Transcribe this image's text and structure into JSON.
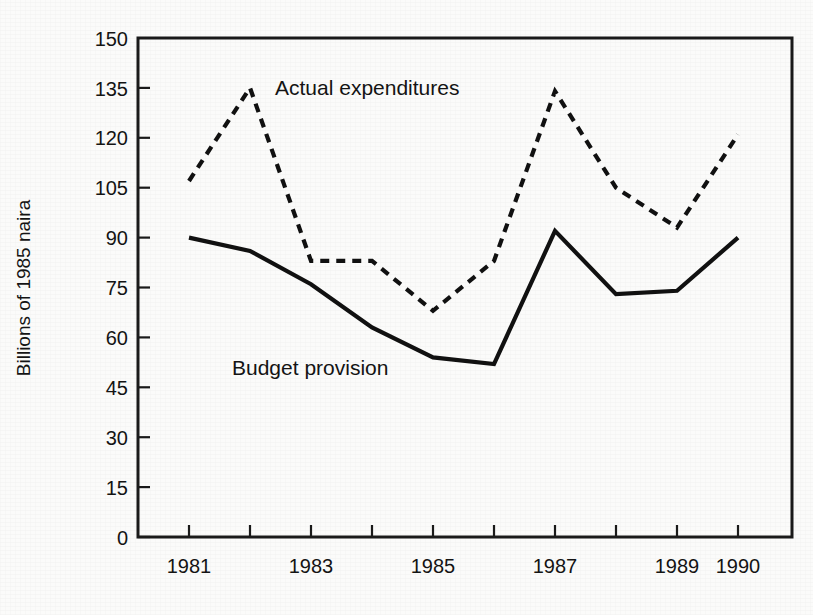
{
  "figure": {
    "background_color": "#fbfbfa",
    "ink_color": "#111111"
  },
  "axis": {
    "y_title": "Billions of 1985 naira",
    "y_ticks": [
      "0",
      "15",
      "30",
      "45",
      "60",
      "75",
      "90",
      "105",
      "120",
      "135",
      "150"
    ],
    "x_ticks": [
      "1981",
      "",
      "1983",
      "",
      "1985",
      "",
      "1987",
      "",
      "1989",
      "1990"
    ]
  },
  "labels": {
    "actual": "Actual expenditures",
    "budget": "Budget provision"
  },
  "chart_data": {
    "type": "line",
    "title": "",
    "xlabel": "",
    "ylabel": "Billions of 1985 naira",
    "ylim": [
      0,
      150
    ],
    "y_tick_step": 15,
    "grid": false,
    "legend_position": "inline-annotations",
    "x": [
      1981,
      1982,
      1983,
      1984,
      1985,
      1986,
      1987,
      1988,
      1989,
      1990
    ],
    "x_tick_labels": [
      "1981",
      "",
      "1983",
      "",
      "1985",
      "",
      "1987",
      "",
      "1989",
      "1990"
    ],
    "series": [
      {
        "name": "Actual expenditures",
        "style": "dashed",
        "values": [
          107,
          135,
          83,
          83,
          68,
          83,
          134,
          105,
          93,
          121
        ]
      },
      {
        "name": "Budget provision",
        "style": "solid",
        "values": [
          90,
          86,
          76,
          63,
          54,
          52,
          92,
          73,
          74,
          90
        ]
      }
    ],
    "annotations": [
      {
        "text": "Actual expenditures",
        "near_x": 1983,
        "near_y": 133
      },
      {
        "text": "Budget provision",
        "near_x": 1983.3,
        "near_y": 56
      }
    ]
  }
}
